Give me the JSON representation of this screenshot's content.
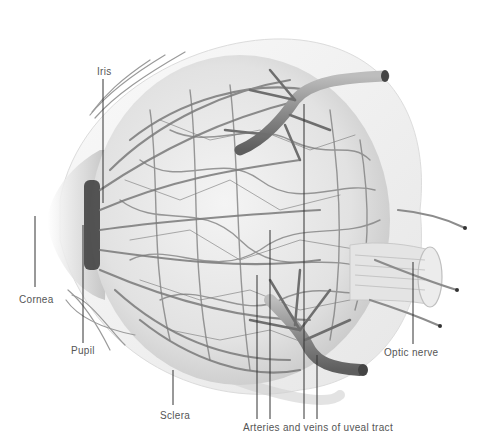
{
  "figure": {
    "labels": {
      "iris": "Iris",
      "cornea": "Cornea",
      "pupil": "Pupil",
      "sclera": "Sclera",
      "arteries_veins": "Arteries and veins of uveal tract",
      "optic_nerve": "Optic nerve"
    }
  },
  "colors": {
    "background": "#ffffff",
    "vessel": "#7a7a7a",
    "vessel_dark": "#4a4a4a",
    "sclera": "#eeeeee",
    "leader_line": "#333333",
    "label_text": "#555555"
  }
}
